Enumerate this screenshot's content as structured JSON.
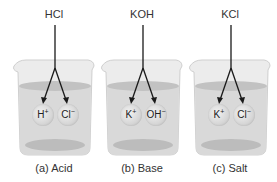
{
  "panels": [
    {
      "id": "acid",
      "formula": "HCl",
      "caption": "(a) Acid",
      "ions": [
        {
          "symbol": "H",
          "charge": "+"
        },
        {
          "symbol": "Cl",
          "charge": "−"
        }
      ]
    },
    {
      "id": "base",
      "formula": "KOH",
      "caption": "(b) Base",
      "ions": [
        {
          "symbol": "K",
          "charge": "+"
        },
        {
          "symbol": "OH",
          "charge": "−"
        }
      ]
    },
    {
      "id": "salt",
      "formula": "KCl",
      "caption": "(c) Salt",
      "ions": [
        {
          "symbol": "K",
          "charge": "+"
        },
        {
          "symbol": "Cl",
          "charge": "−"
        }
      ]
    }
  ],
  "colors": {
    "glass": "#e9e9e9",
    "glass_edge": "#cfcfcf",
    "liquid": "#d9d9d9",
    "liquid_surface": "#bfbfbf",
    "arrow": "#1a1a1a",
    "text": "#333333"
  }
}
